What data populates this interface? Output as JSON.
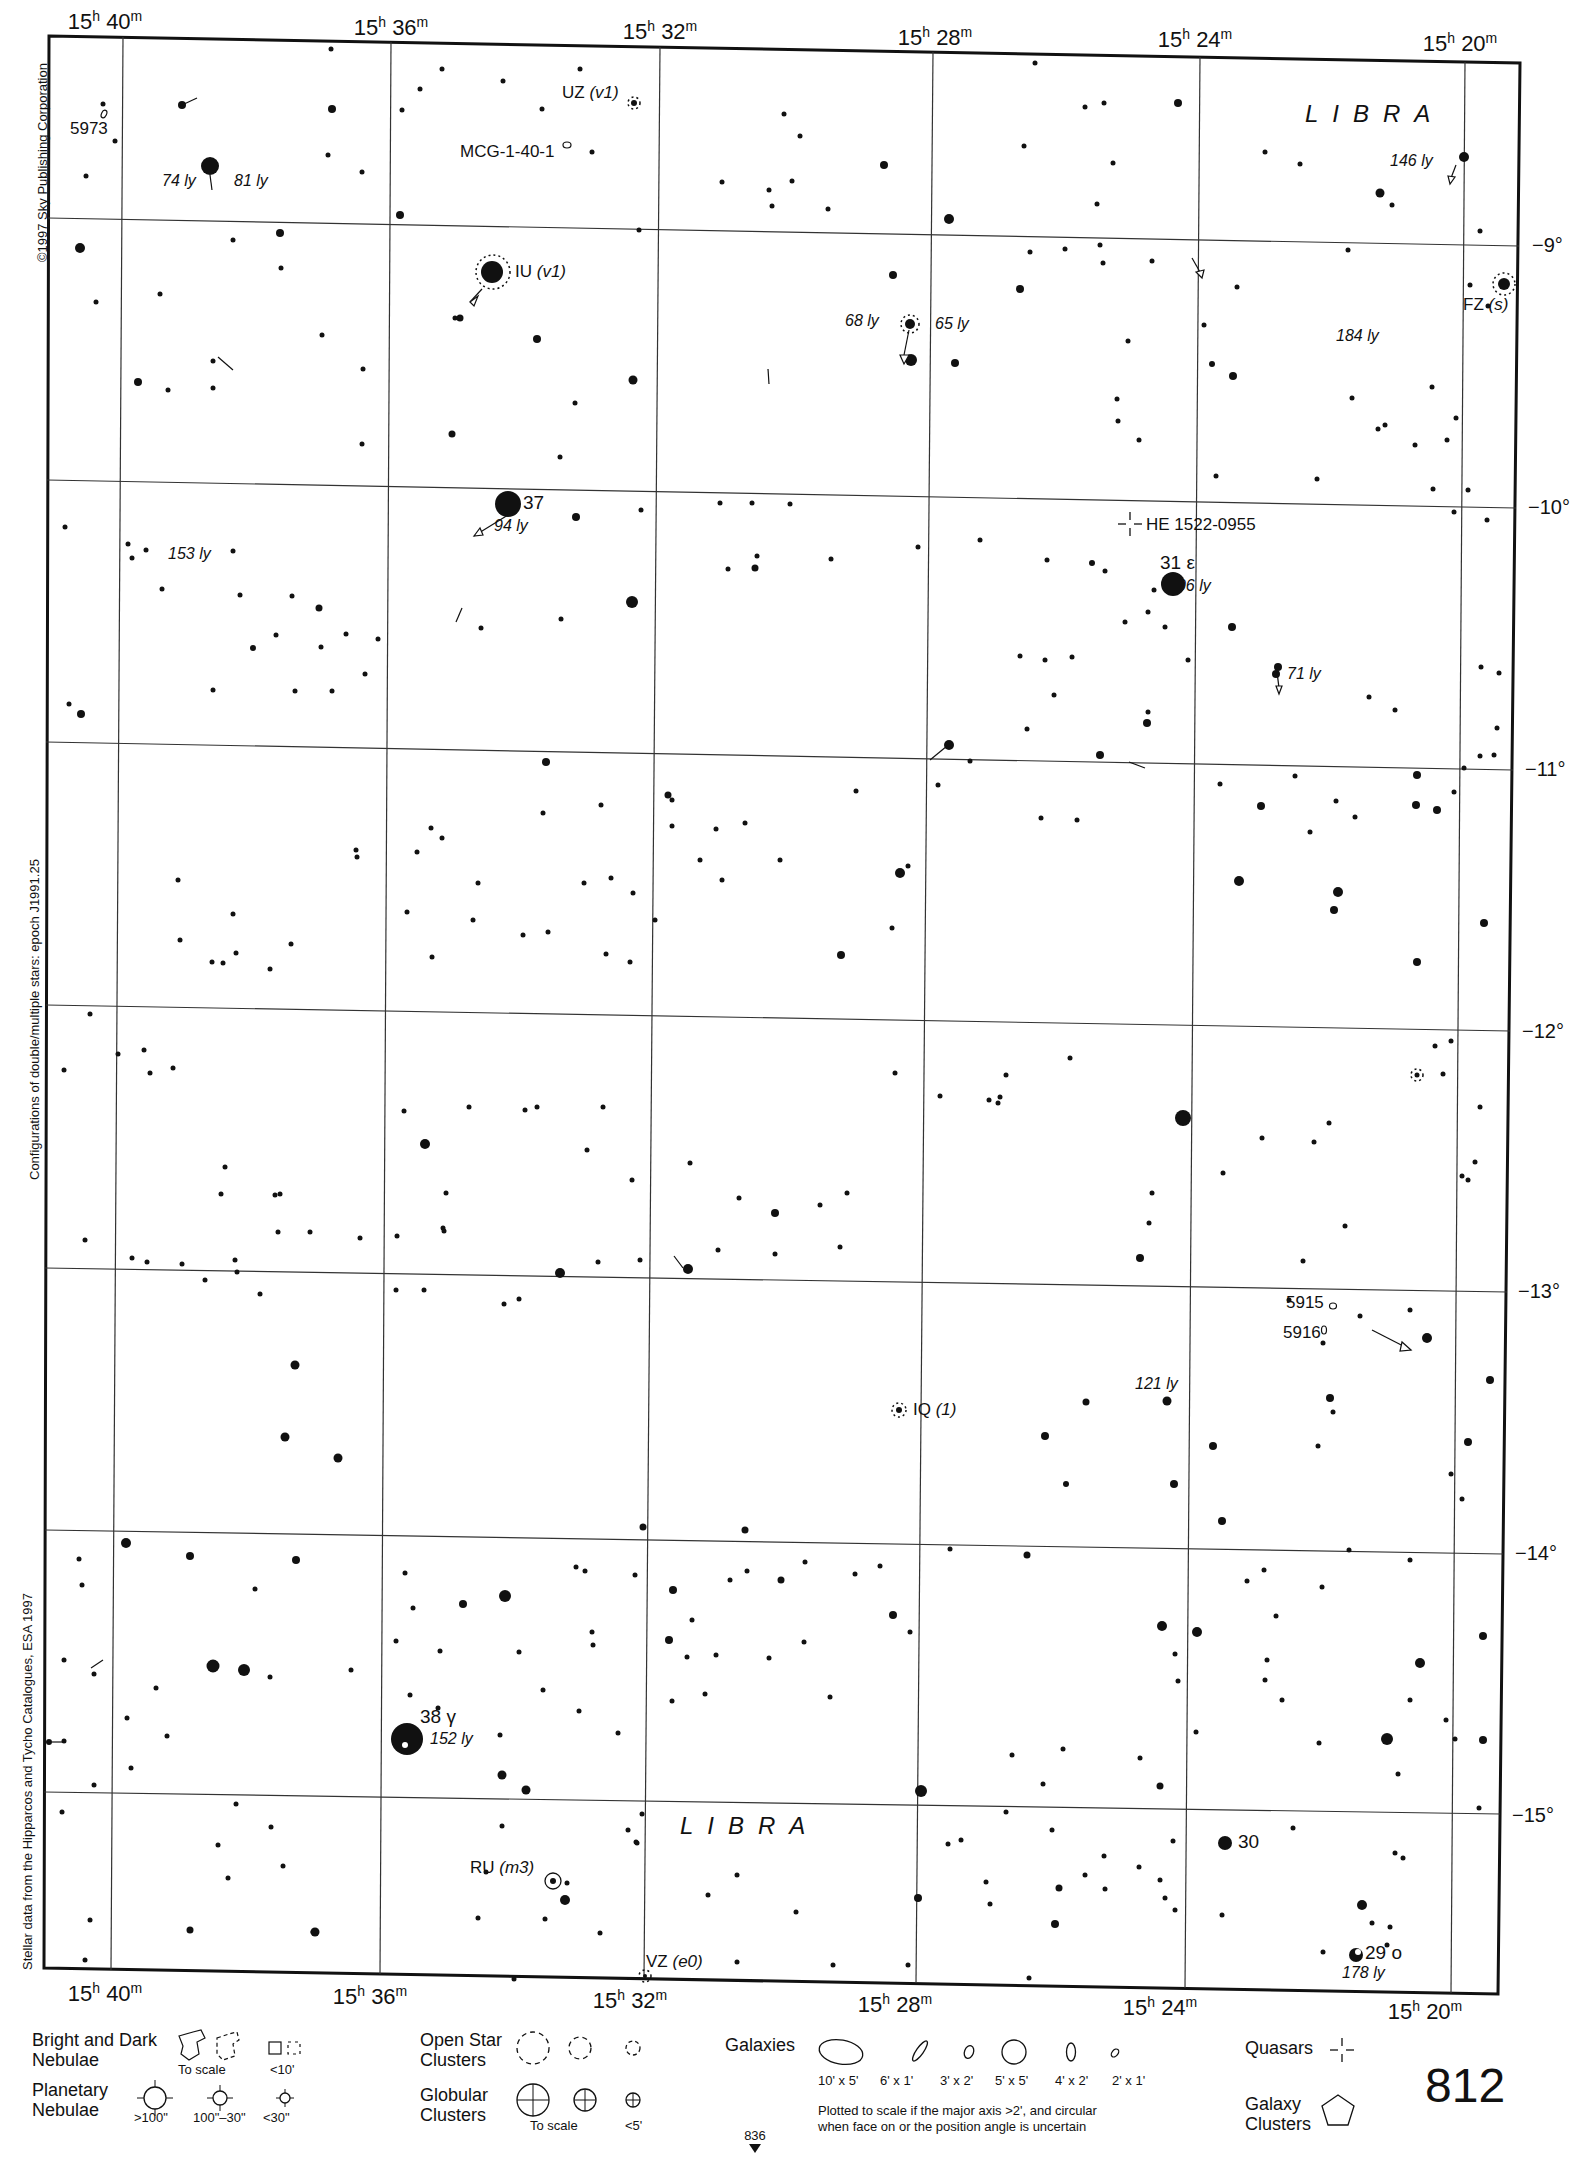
{
  "page": {
    "page_number": "812",
    "next_page_ref": "836",
    "copyright": "©1997 Sky Publishing Corporation",
    "side_note_1": "Configurations of double/multiple stars: epoch J1991.25",
    "side_note_2": "Stellar data from the Hipparcos and Tycho Catalogues, ESA 1997"
  },
  "axes": {
    "ra_labels": [
      {
        "h": "15",
        "m": "40"
      },
      {
        "h": "15",
        "m": "36"
      },
      {
        "h": "15",
        "m": "32"
      },
      {
        "h": "15",
        "m": "28"
      },
      {
        "h": "15",
        "m": "24"
      },
      {
        "h": "15",
        "m": "20"
      }
    ],
    "dec_labels": [
      "−9°",
      "−10°",
      "−11°",
      "−12°",
      "−13°",
      "−14°",
      "−15°"
    ]
  },
  "constellation": {
    "name_top": "LIBRA",
    "name_bottom": "LIBRA"
  },
  "objects": {
    "ngc5973": "5973",
    "mcg": "MCG-1-40-1",
    "uz": {
      "name": "UZ",
      "type": "(v1)"
    },
    "iu": {
      "name": "IU",
      "type": "(v1)"
    },
    "fz": {
      "name": "FZ",
      "type": "(s)"
    },
    "iq": {
      "name": "IQ",
      "type": "(1)"
    },
    "ru": {
      "name": "RU",
      "type": "(m3)"
    },
    "vz": {
      "name": "VZ",
      "type": "(e0)"
    },
    "quasar": "HE 1522-0955",
    "star37": "37",
    "star31": "31 ε",
    "star38": "38 γ",
    "star30": "30",
    "star29": "29 ο",
    "ngc5915": "5915",
    "ngc5916": "5916"
  },
  "distances": {
    "d74": "74 ly",
    "d81": "81 ly",
    "d146": "146 ly",
    "d68": "68 ly",
    "d65": "65 ly",
    "d184": "184 ly",
    "d94": "94 ly",
    "d153": "153 ly",
    "d106": "106 ly",
    "d71": "71 ly",
    "d121": "121 ly",
    "d152": "152 ly",
    "d178": "178 ly"
  },
  "legend": {
    "nebulae_title": "Bright and Dark\nNebulae",
    "nebulae_caps": [
      "To scale",
      "<10'"
    ],
    "planetary_title": "Planetary\nNebulae",
    "planetary_caps": [
      ">100\"",
      "100\"–30\"",
      "<30\""
    ],
    "open_title": "Open Star\nClusters",
    "globular_title": "Globular\nClusters",
    "globular_caps": [
      "To scale",
      "<5'"
    ],
    "galaxies_title": "Galaxies",
    "galaxy_caps": [
      "10' x 5'",
      "6' x 1'",
      "3' x 2'",
      "5' x 5'",
      "4' x 2'",
      "2' x 1'"
    ],
    "galaxy_note": "Plotted to scale if the major axis >2', and circular\nwhen face on or the position angle is uncertain",
    "quasars_title": "Quasars",
    "galaxy_clusters_title": "Galaxy\nClusters"
  },
  "colors": {
    "ink": "#111111",
    "paper": "#ffffff",
    "grid": "#333333"
  }
}
